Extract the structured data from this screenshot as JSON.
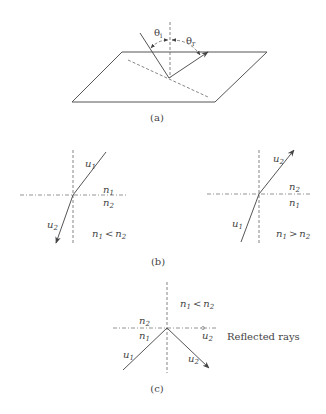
{
  "figure": {
    "panels": [
      {
        "id": "a",
        "caption": "(a)",
        "labels": {
          "theta_i": "θi",
          "theta_i_base": "θ",
          "theta_i_sub": "i",
          "theta_r_base": "θ",
          "theta_r_sub": "r"
        },
        "description": "Reflection at a planar surface with incident angle θi and reflection angle θr measured from surface normal"
      },
      {
        "id": "b",
        "caption": "(b)",
        "left": {
          "ray_in": {
            "base": "u",
            "sub": "1"
          },
          "ray_out": {
            "base": "u",
            "sub": "2"
          },
          "medium_top": {
            "base": "n",
            "sub": "1"
          },
          "medium_bottom": {
            "base": "n",
            "sub": "2"
          },
          "condition": {
            "a": "n",
            "a_sub": "1",
            "op": "<",
            "b": "n",
            "b_sub": "2"
          }
        },
        "right": {
          "ray_in": {
            "base": "u",
            "sub": "1"
          },
          "ray_out": {
            "base": "u",
            "sub": "2"
          },
          "medium_top": {
            "base": "n",
            "sub": "2"
          },
          "medium_bottom": {
            "base": "n",
            "sub": "1"
          },
          "condition": {
            "a": "n",
            "a_sub": "1",
            "op": ">",
            "b": "n",
            "b_sub": "2"
          }
        }
      },
      {
        "id": "c",
        "caption": "(c)",
        "condition": {
          "a": "n",
          "a_sub": "1",
          "op": "<",
          "b": "n",
          "b_sub": "2"
        },
        "medium_top": {
          "base": "n",
          "sub": "2"
        },
        "medium_bottom": {
          "base": "n",
          "sub": "1"
        },
        "ray_in": {
          "base": "u",
          "sub": "1"
        },
        "ray_grazing": {
          "base": "u",
          "sub": "2"
        },
        "ray_reflected": {
          "base": "u",
          "sub": "2"
        },
        "note": "Reflected rays"
      }
    ]
  }
}
